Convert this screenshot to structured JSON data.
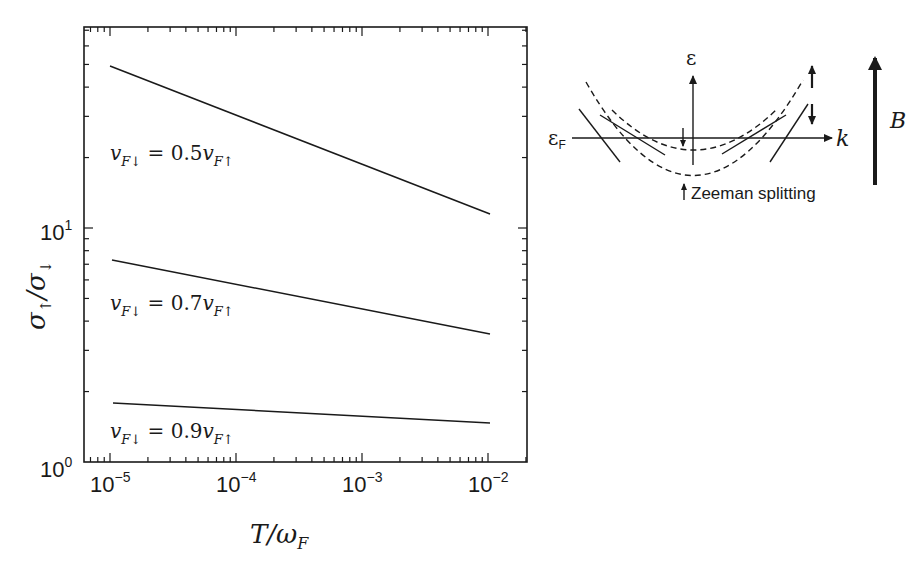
{
  "chart_data": {
    "type": "line",
    "title": "",
    "xlabel": "T/ω_F",
    "ylabel": "σ↑/σ↓",
    "xscale": "log",
    "yscale": "log",
    "xlim": [
      6.3e-06,
      0.014
    ],
    "ylim": [
      1,
      72
    ],
    "grid": false,
    "x_ticks": [
      "10^-5",
      "10^-4",
      "10^-3",
      "10^-2"
    ],
    "y_ticks": [
      "10^0",
      "10^1"
    ],
    "series": [
      {
        "name": "v_F↓ = 0.5 v_F↑",
        "x": [
          1e-05,
          0.01
        ],
        "values": [
          49.2,
          11.5
        ]
      },
      {
        "name": "v_F↓ = 0.7 v_F↑",
        "x": [
          1e-05,
          0.01
        ],
        "values": [
          7.3,
          3.5
        ]
      },
      {
        "name": "v_F↓ = 0.9 v_F↑",
        "x": [
          1e-05,
          0.01
        ],
        "values": [
          1.79,
          1.47
        ]
      }
    ],
    "annotations": [
      "v_F↓ = 0.5v_F↑",
      "v_F↓ = 0.7v_F↑",
      "v_F↓ = 0.9v_F↑"
    ]
  },
  "plot": {
    "xlabel_main": "T/ω",
    "xlabel_sub": "F",
    "ylabel_main": "σ",
    "x_tick_base": "10",
    "x_tick_exps": [
      "−5",
      "−4",
      "−3",
      "−2"
    ],
    "y_tick_base": "10",
    "y_tick_exps": [
      "0",
      "1"
    ],
    "labels": [
      {
        "v": "v",
        "sub1": "F↓",
        "eq": " = 0.5",
        "v2": "v",
        "sub2": "F↑"
      },
      {
        "v": "v",
        "sub1": "F↓",
        "eq": " = 0.7",
        "v2": "v",
        "sub2": "F↑"
      },
      {
        "v": "v",
        "sub1": "F↓",
        "eq": " = 0.9",
        "v2": "v",
        "sub2": "F↑"
      }
    ]
  },
  "schematic": {
    "energy_axis_label": "ε",
    "fermi_label": "ε",
    "fermi_sub": "F",
    "momentum_label": "k",
    "field_label": "B",
    "zeeman_label": "Zeeman splitting"
  }
}
